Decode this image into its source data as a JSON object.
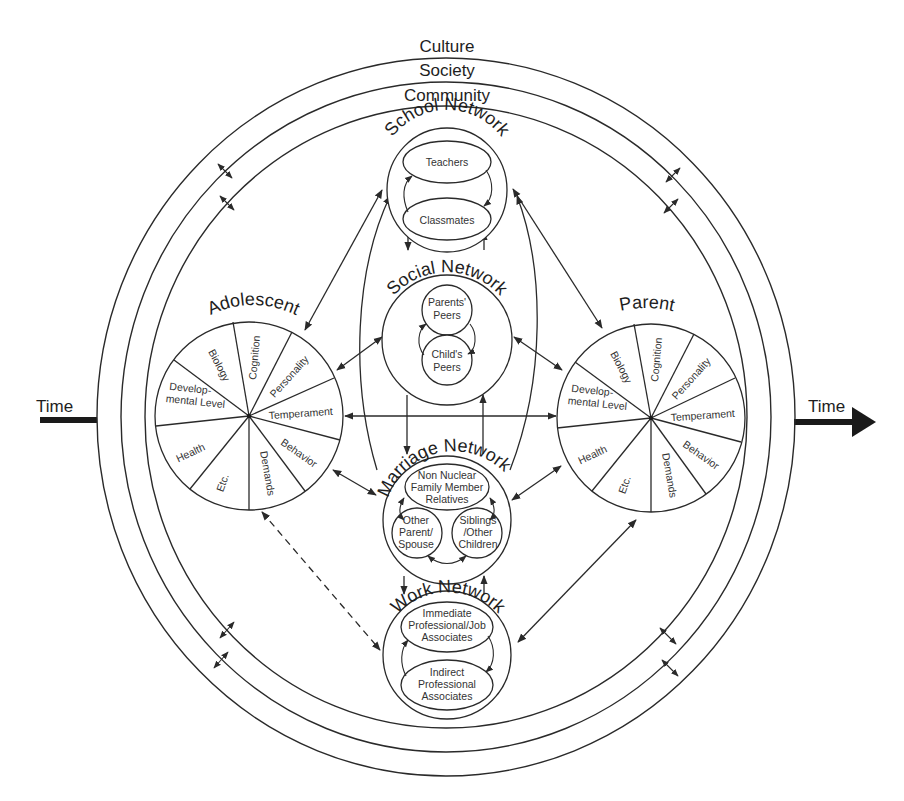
{
  "contexts": {
    "culture": "Culture",
    "society": "Society",
    "community": "Community"
  },
  "time": {
    "left_label": "Time",
    "right_label": "Time"
  },
  "networks": {
    "school": {
      "title": "School Network",
      "members": [
        "Teachers",
        "Classmates"
      ]
    },
    "social": {
      "title": "Social Network",
      "members": [
        "Parents' Peers",
        "Child's Peers"
      ],
      "member_lines": [
        [
          "Parents'",
          "Peers"
        ],
        [
          "Child's",
          "Peers"
        ]
      ]
    },
    "marriage": {
      "title": "Marriage Network",
      "members": [
        "Non Nuclear Family Member Relatives",
        "Other Parent/ Spouse",
        "Siblings /Other Children"
      ],
      "member_lines": [
        [
          "Non Nuclear",
          "Family Member",
          "Relatives"
        ],
        [
          "Other",
          "Parent/",
          "Spouse"
        ],
        [
          "Siblings",
          "/Other",
          "Children"
        ]
      ]
    },
    "work": {
      "title": "Work Network",
      "members": [
        "Immediate Professional/Job Associates",
        "Indirect Professional Associates"
      ],
      "member_lines": [
        [
          "Immediate",
          "Professional/Job",
          "Associates"
        ],
        [
          "Indirect",
          "Professional",
          "Associates"
        ]
      ]
    }
  },
  "individuals": {
    "adolescent": {
      "title": "Adolescent",
      "sectors": [
        "Biology",
        "Cognition",
        "Personality",
        "Temperament",
        "Behavior",
        "Demands",
        "Etc.",
        "Health",
        "Develop- mental Level"
      ],
      "dev_lines": [
        "Develop-",
        "mental Level"
      ]
    },
    "parent": {
      "title": "Parent",
      "sectors": [
        "Biology",
        "Cognition",
        "Personality",
        "Temperament",
        "Behavior",
        "Demands",
        "Etc.",
        "Health",
        "Develop- mental Level"
      ],
      "dev_lines": [
        "Develop-",
        "mental Level"
      ]
    }
  },
  "colors": {
    "line": "#2a2a2a",
    "text": "#1e1e1e",
    "background": "#ffffff"
  }
}
